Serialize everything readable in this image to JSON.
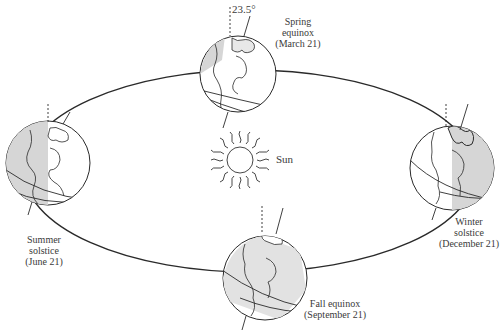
{
  "diagram": {
    "sun": {
      "label": "Sun"
    },
    "tilt_label": "23.5°",
    "positions": [
      {
        "id": "spring",
        "name": "Spring",
        "line2": "equinox",
        "date": "(March 21)"
      },
      {
        "id": "summer",
        "name": "Summer",
        "line2": "solstice",
        "date": "(June 21)"
      },
      {
        "id": "winter",
        "name": "Winter",
        "line2": "solstice",
        "date": "(December 21)"
      },
      {
        "id": "fall",
        "name": "Fall equinox",
        "line2": "",
        "date": "(September 21)"
      }
    ],
    "colors": {
      "line": "#2a2a2a",
      "shade": "#d6d6d6",
      "background": "#ffffff"
    }
  }
}
